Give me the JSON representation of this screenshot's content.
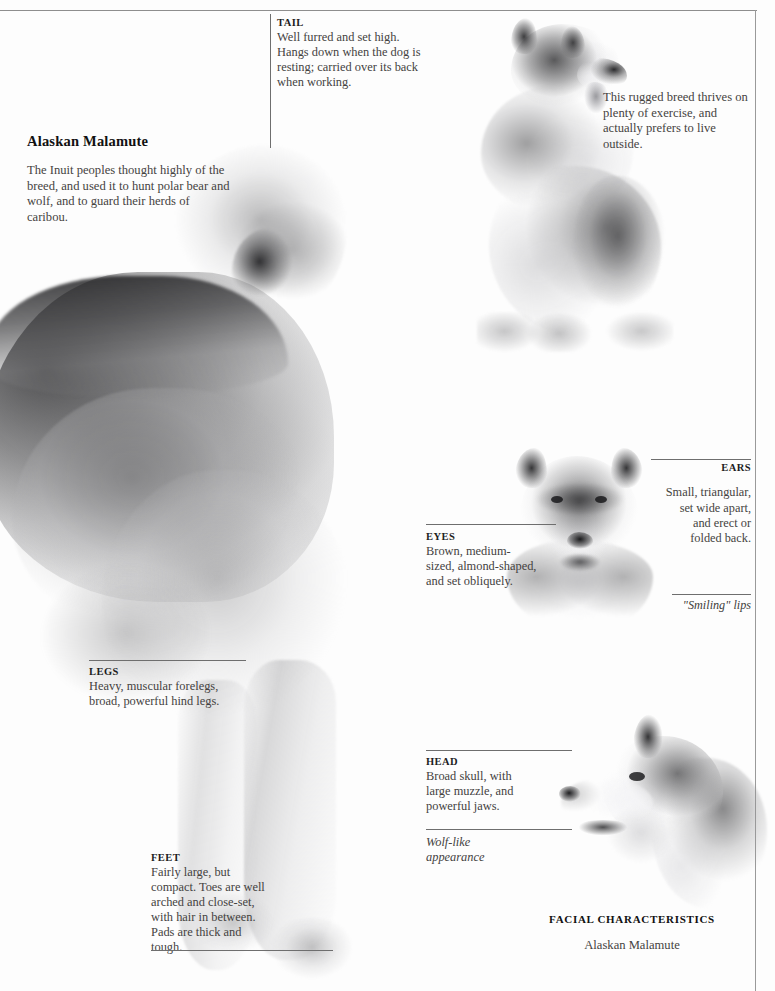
{
  "page": {
    "running_head": "",
    "accent_rule_color": "#6e6e6e",
    "text_color": "#44423f"
  },
  "title_block": {
    "name": "Alaskan Malamute",
    "body": "The Inuit peoples thought highly of the breed, and used it to hunt polar bear and wolf, and to guard their herds of caribou."
  },
  "side_note": {
    "text": "This rugged breed thrives on plenty of exercise, and actually prefers to live outside."
  },
  "callouts": {
    "tail": {
      "header": "TAIL",
      "body": "Well furred and set high. Hangs down when the dog is resting; carried over its back when working."
    },
    "eyes": {
      "header": "EYES",
      "body": "Brown, medium-sized, almond-shaped, and set obliquely."
    },
    "ears": {
      "header": "EARS",
      "body": "Small, triangular, set wide apart, and erect or folded back."
    },
    "smiling_lips": {
      "text": "\"Smiling\" lips"
    },
    "legs": {
      "header": "LEGS",
      "body": "Heavy, muscular forelegs, broad, powerful hind legs."
    },
    "feet": {
      "header": "FEET",
      "body": "Fairly large, but compact. Toes are well arched and close-set, with hair in between. Pads are thick and tough."
    },
    "head": {
      "header": "HEAD",
      "body": "Broad skull, with large muzzle, and powerful jaws."
    },
    "wolf_like": {
      "text": "Wolf-like appearance"
    }
  },
  "caption": {
    "line1": "FACIAL CHARACTERISTICS",
    "line2": "Alaskan Malamute"
  },
  "photos": {
    "standing": "alaskan-malamute-standing-body-photo",
    "sitting": "alaskan-malamute-sitting-photo",
    "face": "alaskan-malamute-front-face-photo",
    "profile": "alaskan-malamute-head-profile-photo"
  }
}
